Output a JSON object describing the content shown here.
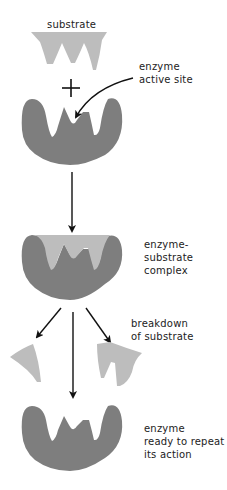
{
  "diagram": {
    "colors": {
      "enzyme": "#7e7e7e",
      "substrate": "#bdbdbd",
      "arrow": "#111111",
      "text": "#222222",
      "background": "#ffffff"
    },
    "labels": {
      "substrate": "substrate",
      "plus": "+",
      "active_site": [
        "enzyme",
        "active site"
      ],
      "complex": [
        "enzyme-",
        "substrate",
        "complex"
      ],
      "breakdown": [
        "breakdown",
        "of substrate"
      ],
      "ready": [
        "enzyme",
        "ready to repeat",
        "its action"
      ]
    },
    "stages": [
      {
        "id": "substrate",
        "shape": "substrate-icon"
      },
      {
        "id": "enzyme",
        "shape": "enzyme-icon"
      },
      {
        "id": "enzyme-substrate-complex",
        "shape": "complex-icon"
      },
      {
        "id": "products",
        "shape": "substrate-fragment-icon"
      },
      {
        "id": "enzyme-free",
        "shape": "enzyme-icon"
      }
    ]
  }
}
